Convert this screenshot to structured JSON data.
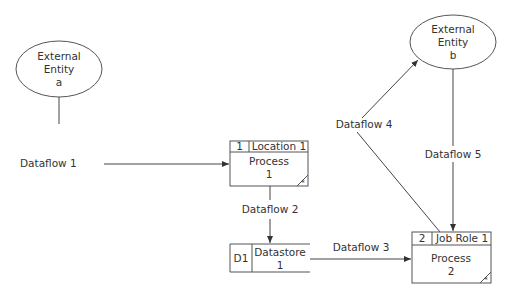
{
  "entities": {
    "a": {
      "line1": "External",
      "line2": "Entity",
      "line3": "a"
    },
    "b": {
      "line1": "External",
      "line2": "Entity",
      "line3": "b"
    }
  },
  "processes": {
    "p1": {
      "id": "1",
      "location": "Location 1",
      "name": "Process",
      "num": "1",
      "marker": "*"
    },
    "p2": {
      "id": "2",
      "location": "Job Role 1",
      "name": "Process",
      "num": "2",
      "marker": "*"
    }
  },
  "datastore": {
    "id": "D1",
    "name": "Datastore",
    "num": "1"
  },
  "flows": {
    "f1": "Dataflow 1",
    "f2": "Dataflow 2",
    "f3": "Dataflow 3",
    "f4": "Dataflow 4",
    "f5": "Dataflow 5"
  },
  "colors": {
    "stroke": "#444444",
    "text": "#333333",
    "background": "#ffffff"
  }
}
